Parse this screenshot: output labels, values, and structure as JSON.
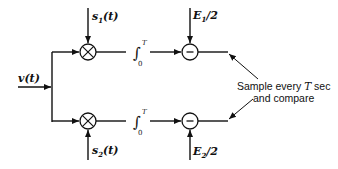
{
  "diagram": {
    "type": "block-diagram",
    "input": {
      "label": "v(t)"
    },
    "branches": [
      {
        "id": "upper",
        "reference_signal": {
          "base": "s",
          "sub": "1",
          "arg": "(t)"
        },
        "multiplier": "⊗",
        "integrator": {
          "symbol": "∫",
          "upper": "T",
          "lower": "0"
        },
        "bias": {
          "base": "E",
          "sub": "1",
          "tail": "/2"
        },
        "summer": "−"
      },
      {
        "id": "lower",
        "reference_signal": {
          "base": "s",
          "sub": "2",
          "arg": "(t)"
        },
        "multiplier": "⊗",
        "integrator": {
          "symbol": "∫",
          "upper": "T",
          "lower": "0"
        },
        "bias": {
          "base": "E",
          "sub": "2",
          "tail": "/2"
        },
        "summer": "−"
      }
    ],
    "annotation": {
      "line1_pre": "Sample every ",
      "line1_var": "T",
      "line1_post": " sec",
      "line2": "and compare"
    },
    "colors": {
      "ink": "#111111",
      "background": "#ffffff"
    }
  }
}
